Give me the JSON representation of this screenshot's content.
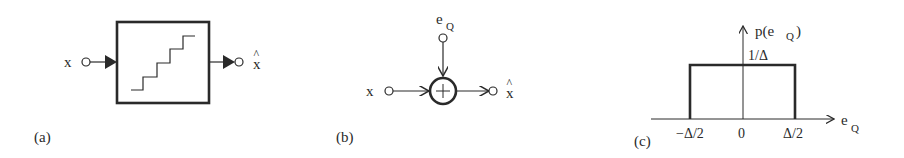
{
  "panels": {
    "a": {
      "caption": "(a)",
      "input_label": "x",
      "output_label": "x",
      "output_hat": "^",
      "block": "quantizer-staircase"
    },
    "b": {
      "caption": "(b)",
      "input_label": "x",
      "noise_label": "e",
      "noise_sub": "Q",
      "output_label": "x",
      "output_hat": "^",
      "sum_symbol": "+"
    },
    "c": {
      "caption": "(c)",
      "y_label": "p(e",
      "y_label_sub": "Q",
      "y_label_close": ")",
      "x_label": "e",
      "x_label_sub": "Q",
      "height_label": "1/Δ",
      "ticks": [
        "−Δ/2",
        "0",
        "Δ/2"
      ]
    }
  },
  "colors": {
    "stroke": "#2a2a2a",
    "background": "#ffffff"
  }
}
